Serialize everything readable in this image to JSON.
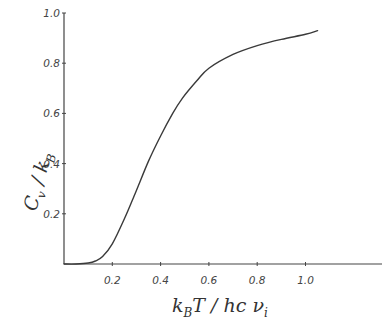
{
  "chart_data": {
    "type": "line",
    "title": "",
    "xlabel": "k_B T / hc ν_i",
    "ylabel": "C_v / k_B",
    "xlim": [
      0,
      1.3
    ],
    "ylim": [
      0,
      1.0
    ],
    "grid": false,
    "legend": null,
    "x_ticks": [
      "0.2",
      "0.4",
      "0.6",
      "0.8",
      "1.0"
    ],
    "y_ticks": [
      "0.2",
      "0.4",
      "0.6",
      "0.8",
      "1.0"
    ],
    "series": [
      {
        "name": "C_v/k_B",
        "x": [
          0.0,
          0.05,
          0.1,
          0.13,
          0.16,
          0.2,
          0.25,
          0.29,
          0.35,
          0.4,
          0.45,
          0.49,
          0.55,
          0.6,
          0.7,
          0.8,
          0.9,
          1.0,
          1.05
        ],
        "y": [
          0.0,
          0.0,
          0.004,
          0.012,
          0.03,
          0.08,
          0.18,
          0.27,
          0.41,
          0.51,
          0.6,
          0.66,
          0.73,
          0.78,
          0.835,
          0.87,
          0.895,
          0.915,
          0.93
        ]
      }
    ]
  },
  "axes": {
    "xlabel_main": "k",
    "xlabel_sub": "B",
    "xlabel_rest": "T / hc ν",
    "xlabel_sub2": "i",
    "ylabel_main": "C",
    "ylabel_sub": "v",
    "ylabel_rest": " / k",
    "ylabel_sub2": "B"
  },
  "style": {
    "line_color": "#3a3a3a",
    "axis_color": "#444444",
    "background": "#ffffff"
  }
}
